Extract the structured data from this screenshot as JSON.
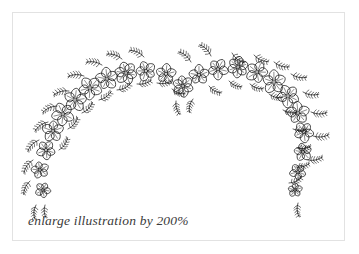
{
  "page": {
    "width": 359,
    "height": 254,
    "background_color": "#ffffff"
  },
  "frame": {
    "name": "illustration-border",
    "border_color": "#e2e2e2",
    "x": 12,
    "y": 12,
    "width": 333,
    "height": 229
  },
  "caption": {
    "text": "enlarge illustration by 200%",
    "color": "#3a3a3a",
    "style": "italic serif"
  },
  "illustration": {
    "title": "floral arch",
    "description": "hand-drawn arch of five-petal flowers with fern leaf sprigs",
    "ink_color": "#1a1a1a",
    "stroke_width": 0.8,
    "flowers": [
      {
        "cx": 43,
        "cy": 190,
        "r": 7.5,
        "petals": 5,
        "rot": 10
      },
      {
        "cx": 40,
        "cy": 170,
        "r": 8.5,
        "petals": 5,
        "rot": 40
      },
      {
        "cx": 46,
        "cy": 150,
        "r": 9.5,
        "petals": 5,
        "rot": 15
      },
      {
        "cx": 53,
        "cy": 131,
        "r": 10.5,
        "petals": 5,
        "rot": 55
      },
      {
        "cx": 63,
        "cy": 114,
        "r": 11,
        "petals": 5,
        "rot": 25
      },
      {
        "cx": 75,
        "cy": 100,
        "r": 11.5,
        "petals": 5,
        "rot": 60
      },
      {
        "cx": 90,
        "cy": 88,
        "r": 11.5,
        "petals": 5,
        "rot": 20
      },
      {
        "cx": 107,
        "cy": 79,
        "r": 11,
        "petals": 5,
        "rot": 45
      },
      {
        "cx": 126,
        "cy": 73,
        "r": 11,
        "petals": 6,
        "rot": 10
      },
      {
        "cx": 146,
        "cy": 71,
        "r": 10,
        "petals": 5,
        "rot": 35
      },
      {
        "cx": 166,
        "cy": 74,
        "r": 10,
        "petals": 5,
        "rot": 60
      },
      {
        "cx": 183,
        "cy": 86,
        "r": 10.5,
        "petals": 6,
        "rot": 20
      },
      {
        "cx": 199,
        "cy": 75,
        "r": 10,
        "petals": 5,
        "rot": 50
      },
      {
        "cx": 218,
        "cy": 69,
        "r": 10.5,
        "petals": 5,
        "rot": 15
      },
      {
        "cx": 238,
        "cy": 67,
        "r": 11,
        "petals": 6,
        "rot": 40
      },
      {
        "cx": 257,
        "cy": 72,
        "r": 11,
        "petals": 5,
        "rot": 5
      },
      {
        "cx": 274,
        "cy": 82,
        "r": 11.5,
        "petals": 5,
        "rot": 55
      },
      {
        "cx": 288,
        "cy": 96,
        "r": 11.5,
        "petals": 5,
        "rot": 25
      },
      {
        "cx": 298,
        "cy": 113,
        "r": 11,
        "petals": 5,
        "rot": 50
      },
      {
        "cx": 304,
        "cy": 132,
        "r": 10,
        "petals": 5,
        "rot": 15
      },
      {
        "cx": 303,
        "cy": 152,
        "r": 9,
        "petals": 5,
        "rot": 45
      },
      {
        "cx": 298,
        "cy": 172,
        "r": 8,
        "petals": 5,
        "rot": 20
      },
      {
        "cx": 295,
        "cy": 190,
        "r": 7,
        "petals": 5,
        "rot": 55
      }
    ],
    "sprigs": [
      {
        "x": 36,
        "y": 205,
        "a": 95,
        "len": 14,
        "n": 5
      },
      {
        "x": 30,
        "y": 181,
        "a": 115,
        "len": 15,
        "n": 5
      },
      {
        "x": 33,
        "y": 160,
        "a": 125,
        "len": 16,
        "n": 5
      },
      {
        "x": 39,
        "y": 140,
        "a": 135,
        "len": 16,
        "n": 5
      },
      {
        "x": 48,
        "y": 122,
        "a": 145,
        "len": 16,
        "n": 5
      },
      {
        "x": 59,
        "y": 150,
        "a": -55,
        "len": 15,
        "n": 5
      },
      {
        "x": 68,
        "y": 129,
        "a": -50,
        "len": 15,
        "n": 5
      },
      {
        "x": 57,
        "y": 106,
        "a": 155,
        "len": 16,
        "n": 5
      },
      {
        "x": 82,
        "y": 113,
        "a": -45,
        "len": 15,
        "n": 5
      },
      {
        "x": 69,
        "y": 91,
        "a": 165,
        "len": 16,
        "n": 5
      },
      {
        "x": 99,
        "y": 100,
        "a": -35,
        "len": 15,
        "n": 5
      },
      {
        "x": 84,
        "y": 76,
        "a": 178,
        "len": 16,
        "n": 5
      },
      {
        "x": 117,
        "y": 90,
        "a": -25,
        "len": 15,
        "n": 5
      },
      {
        "x": 102,
        "y": 65,
        "a": -170,
        "len": 16,
        "n": 5
      },
      {
        "x": 137,
        "y": 84,
        "a": -15,
        "len": 15,
        "n": 5
      },
      {
        "x": 122,
        "y": 59,
        "a": -162,
        "len": 16,
        "n": 5
      },
      {
        "x": 157,
        "y": 83,
        "a": -8,
        "len": 15,
        "n": 5
      },
      {
        "x": 144,
        "y": 57,
        "a": -155,
        "len": 16,
        "n": 5
      },
      {
        "x": 172,
        "y": 89,
        "a": 20,
        "len": 14,
        "n": 5
      },
      {
        "x": 176,
        "y": 101,
        "a": 75,
        "len": 14,
        "n": 5
      },
      {
        "x": 193,
        "y": 99,
        "a": 105,
        "len": 14,
        "n": 5
      },
      {
        "x": 191,
        "y": 62,
        "a": -140,
        "len": 16,
        "n": 5
      },
      {
        "x": 209,
        "y": 86,
        "a": 30,
        "len": 14,
        "n": 5
      },
      {
        "x": 211,
        "y": 56,
        "a": -135,
        "len": 16,
        "n": 5
      },
      {
        "x": 229,
        "y": 81,
        "a": 25,
        "len": 14,
        "n": 5
      },
      {
        "x": 232,
        "y": 53,
        "a": 38,
        "len": 16,
        "n": 5
      },
      {
        "x": 250,
        "y": 84,
        "a": 20,
        "len": 14,
        "n": 5
      },
      {
        "x": 254,
        "y": 55,
        "a": 25,
        "len": 16,
        "n": 5
      },
      {
        "x": 269,
        "y": 94,
        "a": 15,
        "len": 14,
        "n": 5
      },
      {
        "x": 274,
        "y": 62,
        "a": 18,
        "len": 16,
        "n": 5
      },
      {
        "x": 283,
        "y": 110,
        "a": 10,
        "len": 14,
        "n": 5
      },
      {
        "x": 291,
        "y": 74,
        "a": 12,
        "len": 16,
        "n": 5
      },
      {
        "x": 293,
        "y": 129,
        "a": 0,
        "len": 14,
        "n": 5
      },
      {
        "x": 303,
        "y": 92,
        "a": 8,
        "len": 16,
        "n": 5
      },
      {
        "x": 297,
        "y": 148,
        "a": -8,
        "len": 14,
        "n": 5
      },
      {
        "x": 311,
        "y": 112,
        "a": 2,
        "len": 16,
        "n": 5
      },
      {
        "x": 296,
        "y": 167,
        "a": -15,
        "len": 14,
        "n": 5
      },
      {
        "x": 313,
        "y": 136,
        "a": -5,
        "len": 16,
        "n": 5
      },
      {
        "x": 289,
        "y": 183,
        "a": -25,
        "len": 14,
        "n": 5
      },
      {
        "x": 308,
        "y": 160,
        "a": -12,
        "len": 15,
        "n": 5
      },
      {
        "x": 298,
        "y": 203,
        "a": 85,
        "len": 14,
        "n": 5
      },
      {
        "x": 45,
        "y": 205,
        "a": 85,
        "len": 13,
        "n": 4
      }
    ]
  }
}
